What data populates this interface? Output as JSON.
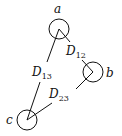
{
  "diagram": {
    "nodes": [
      {
        "id": "a",
        "label": "a",
        "cx": 59,
        "cy": 30,
        "r": 10,
        "lx": 58,
        "ly": 12
      },
      {
        "id": "b",
        "label": "b",
        "cx": 92,
        "cy": 72,
        "r": 10,
        "lx": 111,
        "ly": 78
      },
      {
        "id": "c",
        "label": "c",
        "cx": 26,
        "cy": 120,
        "r": 10,
        "lx": 11,
        "ly": 124
      }
    ],
    "edges": [
      {
        "from": "a",
        "to": "b",
        "label_main": "D",
        "label_sub": "12"
      },
      {
        "from": "a",
        "to": "c",
        "label_main": "D",
        "label_sub": "13"
      },
      {
        "from": "b",
        "to": "c",
        "label_main": "D",
        "label_sub": "23"
      }
    ]
  },
  "labels": {
    "a": "a",
    "b": "b",
    "c": "c",
    "d12_main": "D",
    "d12_sub": "12",
    "d13_main": "D",
    "d13_sub": "13",
    "d23_main": "D",
    "d23_sub": "23"
  }
}
